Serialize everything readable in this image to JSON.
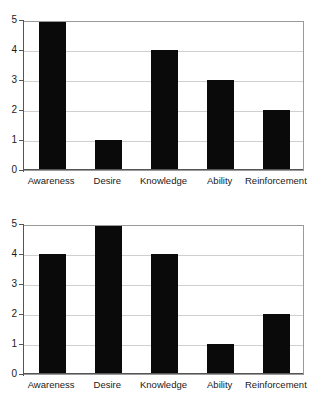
{
  "chart_data": [
    {
      "type": "bar",
      "title": "",
      "xlabel": "",
      "ylabel": "",
      "categories": [
        "Awareness",
        "Desire",
        "Knowledge",
        "Ability",
        "Reinforcement"
      ],
      "values": [
        5,
        1,
        4,
        3,
        2
      ],
      "yticks": [
        "0",
        "1",
        "2",
        "3",
        "4",
        "5"
      ],
      "ylim": [
        0,
        5
      ],
      "grid": true,
      "legend": false,
      "bar_color": "#0a0a0a",
      "grid_color": "#cfcfcf",
      "axis_color": "#555555",
      "background": "#ffffff"
    },
    {
      "type": "bar",
      "title": "",
      "xlabel": "",
      "ylabel": "",
      "categories": [
        "Awareness",
        "Desire",
        "Knowledge",
        "Ability",
        "Reinforcement"
      ],
      "values": [
        4,
        5,
        4,
        1,
        2
      ],
      "yticks": [
        "0",
        "1",
        "2",
        "3",
        "4",
        "5"
      ],
      "ylim": [
        0,
        5
      ],
      "grid": true,
      "legend": false,
      "bar_color": "#0a0a0a",
      "grid_color": "#cfcfcf",
      "axis_color": "#555555",
      "background": "#ffffff"
    }
  ]
}
